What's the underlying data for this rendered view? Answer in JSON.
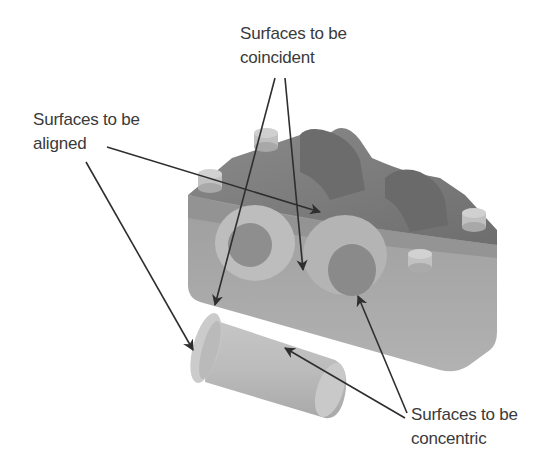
{
  "diagram": {
    "type": "assembly-mate-annotation",
    "colors": {
      "background": "#ffffff",
      "text": "#3a3a3a",
      "arrow": "#2e2e2e",
      "block_top": "#7c7c7c",
      "block_front": "#a8a8a8",
      "block_side": "#9a9a9a",
      "pin_top": "#c8c8c8",
      "bushing": "#bdbdbd"
    }
  },
  "labels": {
    "coincident": {
      "line1": "Surfaces to be",
      "line2": "coincident"
    },
    "aligned": {
      "line1": "Surfaces to be",
      "line2": "aligned"
    },
    "concentric": {
      "line1": "Surfaces to be",
      "line2": "concentric"
    }
  },
  "arrows": [
    {
      "id": "coincident-to-bushing-flange",
      "from": [
        275,
        78
      ],
      "to": [
        215,
        305
      ]
    },
    {
      "id": "coincident-to-block-face",
      "from": [
        285,
        78
      ],
      "to": [
        303,
        270
      ]
    },
    {
      "id": "aligned-to-block-slot",
      "from": [
        107,
        147
      ],
      "to": [
        320,
        212
      ]
    },
    {
      "id": "aligned-to-bushing-flange",
      "from": [
        86,
        162
      ],
      "to": [
        193,
        350
      ]
    },
    {
      "id": "concentric-to-block-bore",
      "from": [
        407,
        413
      ],
      "to": [
        358,
        296
      ]
    },
    {
      "id": "concentric-to-bushing",
      "from": [
        405,
        418
      ],
      "to": [
        285,
        348
      ]
    }
  ]
}
